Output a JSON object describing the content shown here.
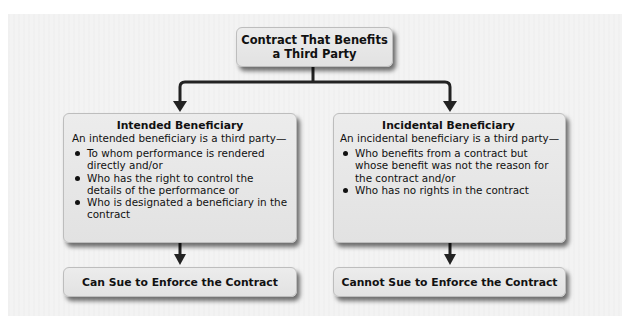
{
  "diagram": {
    "root": {
      "line1": "Contract That Benefits",
      "line2": "a Third Party"
    },
    "intended": {
      "title": "Intended Beneficiary",
      "intro": "An intended beneficiary is a third party—",
      "bullets": [
        "To whom performance is rendered directly and/or",
        "Who has the right to control the details of the performance or",
        "Who is designated a beneficiary in the contract"
      ],
      "outcome": "Can Sue to Enforce the Contract"
    },
    "incidental": {
      "title": "Incidental Beneficiary",
      "intro": "An incidental beneficiary is a third party—",
      "bullets": [
        "Who benefits from a contract but whose benefit was not the reason for the contract and/or",
        "Who has no rights in the contract"
      ],
      "outcome": "Cannot Sue to Enforce the Contract"
    },
    "colors": {
      "box_fill": "#e6e6e6",
      "panel_fill": "#f3f3f3",
      "connector": "#222222"
    }
  }
}
